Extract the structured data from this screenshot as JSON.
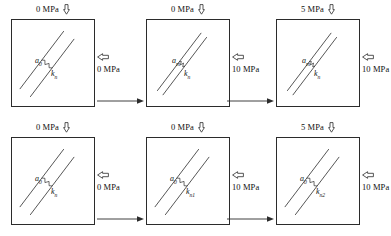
{
  "diagram": {
    "units": "MPa",
    "icons": {
      "vertical_load": "hollow-down-arrow-icon",
      "horizontal_load": "hollow-left-arrow-icon",
      "sequence": "right-arrow-icon",
      "spring": "zigzag-spring-icon"
    },
    "colors": {
      "line": "#2b2b2b",
      "background": "#ffffff",
      "text": "#111111"
    }
  },
  "rows": [
    {
      "name": "aperture-variation-row",
      "description": "Aperture reduces as stress increases; normal stiffness label constant",
      "panels": [
        {
          "name": "panel-top-1",
          "vertical_stress": "0 MPa",
          "horizontal_stress": "0 MPa",
          "aperture_label": "a",
          "aperture_sub": "0",
          "stiffness_label": "k",
          "stiffness_sub": "n",
          "fracture_gap": 13
        },
        {
          "name": "panel-top-2",
          "vertical_stress": "0 MPa",
          "horizontal_stress": "10 MPa",
          "aperture_label": "a",
          "aperture_sub": "m",
          "stiffness_label": "k",
          "stiffness_sub": "n",
          "fracture_gap": 7
        },
        {
          "name": "panel-top-3",
          "vertical_stress": "5 MPa",
          "horizontal_stress": "10 MPa",
          "aperture_label": "a",
          "aperture_sub": "m",
          "stiffness_label": "k",
          "stiffness_sub": "n",
          "fracture_gap": 7
        }
      ]
    },
    {
      "name": "stiffness-variation-row",
      "description": "Aperture label constant; normal stiffness increases with stress",
      "panels": [
        {
          "name": "panel-bottom-1",
          "vertical_stress": "0 MPa",
          "horizontal_stress": "0 MPa",
          "aperture_label": "a",
          "aperture_sub": "0",
          "stiffness_label": "k",
          "stiffness_sub": "n",
          "fracture_gap": 13
        },
        {
          "name": "panel-bottom-2",
          "vertical_stress": "0 MPa",
          "horizontal_stress": "10 MPa",
          "aperture_label": "a",
          "aperture_sub": "0",
          "stiffness_label": "k",
          "stiffness_sub": "n1",
          "fracture_gap": 13
        },
        {
          "name": "panel-bottom-3",
          "vertical_stress": "5 MPa",
          "horizontal_stress": "10 MPa",
          "aperture_label": "a",
          "aperture_sub": "0",
          "stiffness_label": "k",
          "stiffness_sub": "n2",
          "fracture_gap": 13
        }
      ]
    }
  ]
}
